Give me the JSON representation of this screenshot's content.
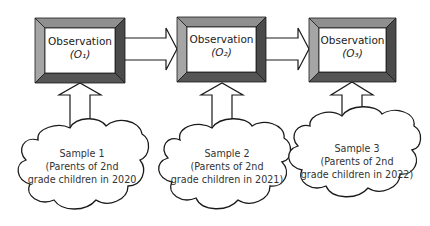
{
  "observations": [
    {
      "label": "Observation",
      "symbol": "(O1)",
      "symbol_display": "(O₁)"
    },
    {
      "label": "Observation",
      "symbol": "(O2)",
      "symbol_display": "(O₂)"
    },
    {
      "label": "Observation",
      "symbol": "(O3)",
      "symbol_display": "(O₃)"
    }
  ],
  "samples": [
    {
      "title": "Sample 1",
      "line2": "(Parents of 2nd",
      "line3": "grade children in 2020"
    },
    {
      "title": "Sample 2",
      "line2": "(Parents of 2nd",
      "line3": "grade children in 2021)"
    },
    {
      "title": "Sample 3",
      "line2": "(Parents of 2nd",
      "line3": "grade children in 2022)"
    }
  ],
  "colors": {
    "bevel_light": "#9a9a9a",
    "bevel_dark": "#4a4a4a",
    "bevel_mid": "#7a7a7a",
    "stroke": "#1a1a1a"
  }
}
